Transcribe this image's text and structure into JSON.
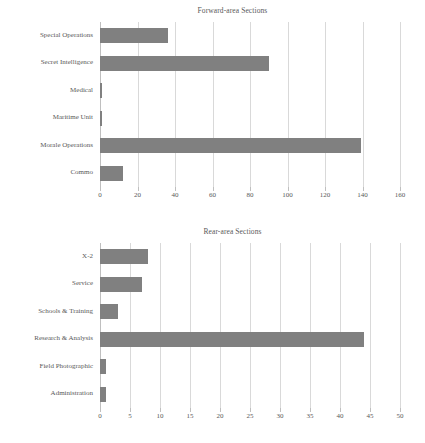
{
  "chart_data": [
    {
      "type": "bar",
      "orientation": "horizontal",
      "title": "Forward-area Sections",
      "xlabel": "",
      "ylabel": "",
      "categories": [
        "Special Operations",
        "Secret Intelligence",
        "Medical",
        "Maritime Unit",
        "Morale Operations",
        "Commo"
      ],
      "values": [
        36,
        90,
        1,
        1,
        139,
        12
      ],
      "xlim": [
        0,
        160
      ],
      "xticks": [
        0,
        20,
        40,
        60,
        80,
        100,
        120,
        140,
        160
      ],
      "xtick_labels": [
        "0",
        "20",
        "40",
        "60",
        "80",
        "100",
        "120",
        "140",
        "160"
      ],
      "grid": true,
      "legend": "none",
      "bar_color": "#808080"
    },
    {
      "type": "bar",
      "orientation": "horizontal",
      "title": "Rear-area Sections",
      "xlabel": "",
      "ylabel": "",
      "categories": [
        "X-2",
        "Service",
        "Schools & Training",
        "Research & Analysis",
        "Field Photographic",
        "Administration"
      ],
      "values": [
        8,
        7,
        3,
        44,
        1,
        1
      ],
      "xlim": [
        0,
        50
      ],
      "xticks": [
        0,
        5,
        10,
        15,
        20,
        25,
        30,
        35,
        40,
        45,
        50
      ],
      "xtick_labels": [
        "0",
        "5",
        "10",
        "15",
        "20",
        "25",
        "30",
        "35",
        "40",
        "45",
        "50"
      ],
      "grid": true,
      "legend": "none",
      "bar_color": "#808080"
    }
  ]
}
